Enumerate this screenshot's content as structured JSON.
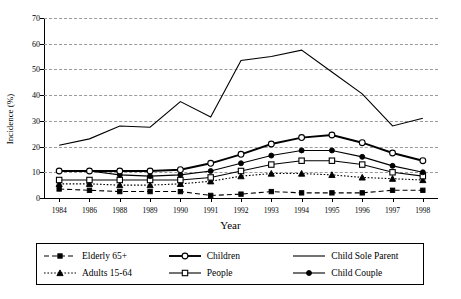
{
  "chart_data": {
    "type": "line",
    "title": "",
    "xlabel": "Year",
    "ylabel": "Incidence (%)",
    "ylim": [
      0,
      70
    ],
    "ytick_step": 10,
    "yticks": [
      "0",
      "10",
      "20",
      "30",
      "40",
      "50",
      "60",
      "70"
    ],
    "grid": "horizontal-dashed",
    "legend_position": "bottom",
    "categories": [
      "1984",
      "1986",
      "1988",
      "1989",
      "1990",
      "1991",
      "1992",
      "1993",
      "1994",
      "1995",
      "1996",
      "1997",
      "1998"
    ],
    "series": [
      {
        "name": "Elderly 65+",
        "marker": "filled-square",
        "line": "dashed",
        "values": [
          3.5,
          3.0,
          2.5,
          2.5,
          2.5,
          1.0,
          1.5,
          2.5,
          2.0,
          2.0,
          2.0,
          3.0,
          3.0
        ]
      },
      {
        "name": "Adults 15-64",
        "marker": "filled-triangle",
        "line": "dotted",
        "values": [
          5.5,
          5.5,
          5.0,
          5.0,
          5.5,
          6.5,
          8.5,
          9.5,
          9.5,
          9.0,
          8.0,
          7.5,
          7.0
        ]
      },
      {
        "name": "Children",
        "marker": "open-circle",
        "line": "solid-thick",
        "values": [
          10.5,
          10.5,
          10.5,
          10.5,
          11.0,
          13.5,
          17.0,
          21.0,
          23.5,
          24.5,
          21.5,
          17.5,
          14.5
        ]
      },
      {
        "name": "People",
        "marker": "open-square",
        "line": "solid",
        "values": [
          7.0,
          7.0,
          7.0,
          7.0,
          7.0,
          8.0,
          10.5,
          13.0,
          14.5,
          14.5,
          13.0,
          10.0,
          8.5
        ]
      },
      {
        "name": "Child Sole Parent",
        "marker": "none",
        "line": "solid",
        "values": [
          20.5,
          23.0,
          28.0,
          27.5,
          37.5,
          31.5,
          53.5,
          55.0,
          57.5,
          49.0,
          40.5,
          28.0,
          31.0
        ]
      },
      {
        "name": "Child Couple",
        "marker": "filled-circle",
        "line": "solid",
        "values": [
          10.5,
          10.5,
          9.0,
          8.5,
          9.0,
          10.5,
          13.5,
          16.5,
          18.5,
          18.5,
          16.0,
          12.5,
          10.0
        ]
      }
    ]
  },
  "legend": {
    "items": [
      {
        "label": "Elderly 65+"
      },
      {
        "label": "Adults 15-64"
      },
      {
        "label": "Children"
      },
      {
        "label": "People"
      },
      {
        "label": "Child Sole Parent"
      },
      {
        "label": "Child Couple"
      }
    ]
  },
  "colors": {
    "line": "#000000",
    "grid": "#9a9a9a",
    "background": "#ffffff"
  }
}
